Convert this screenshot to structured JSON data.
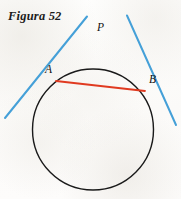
{
  "figure": {
    "title": "Figura 52",
    "caption_position": "top-left",
    "background_color": "#fdfcfb",
    "width": 181,
    "height": 199
  },
  "labels": {
    "intersection_point": "P",
    "tangency_left": "A",
    "tangency_right": "B"
  },
  "colors": {
    "tangent_line": "#45a0d8",
    "chord": "#e03a20",
    "circle": "#1a1a1a",
    "text": "#111111"
  },
  "geometry": {
    "circle": {
      "cx": 93,
      "cy": 129.5,
      "r": 60.5,
      "stroke_width": 1.4
    },
    "point_P": {
      "x": 103,
      "y": 40
    },
    "point_A": {
      "x": 56,
      "y": 81
    },
    "point_B": {
      "x": 145,
      "y": 91
    },
    "tangent_left": {
      "x1": 87,
      "y1": 16.5,
      "x2": 5,
      "y2": 118
    },
    "tangent_right": {
      "x1": 127,
      "y1": 15.5,
      "x2": 176,
      "y2": 125
    },
    "chord_AB": {
      "x1": 56,
      "y1": 81,
      "x2": 145,
      "y2": 91
    },
    "tangent_stroke_width": 2.0,
    "chord_stroke_width": 1.8
  }
}
